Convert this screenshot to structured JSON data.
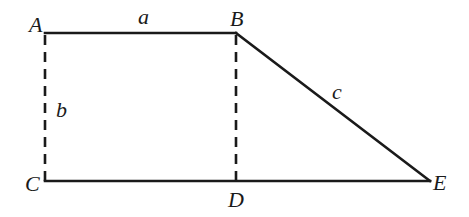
{
  "diagram": {
    "type": "geometry-figure",
    "points": {
      "A": {
        "label": "A",
        "x": 45,
        "y": 33
      },
      "B": {
        "label": "B",
        "x": 236,
        "y": 33
      },
      "C": {
        "label": "C",
        "x": 45,
        "y": 181
      },
      "D": {
        "label": "D",
        "x": 236,
        "y": 181
      },
      "E": {
        "label": "E",
        "x": 430,
        "y": 181
      }
    },
    "segments": [
      {
        "from": "A",
        "to": "B",
        "style": "solid",
        "label": "a"
      },
      {
        "from": "B",
        "to": "E",
        "style": "solid",
        "label": "c"
      },
      {
        "from": "C",
        "to": "E",
        "style": "solid",
        "label": ""
      },
      {
        "from": "A",
        "to": "C",
        "style": "dashed",
        "label": "b"
      },
      {
        "from": "B",
        "to": "D",
        "style": "dashed",
        "label": ""
      }
    ],
    "side_labels": {
      "a": "a",
      "b": "b",
      "c": "c"
    },
    "colors": {
      "stroke": "#1a1a1a",
      "background": "#ffffff"
    }
  }
}
